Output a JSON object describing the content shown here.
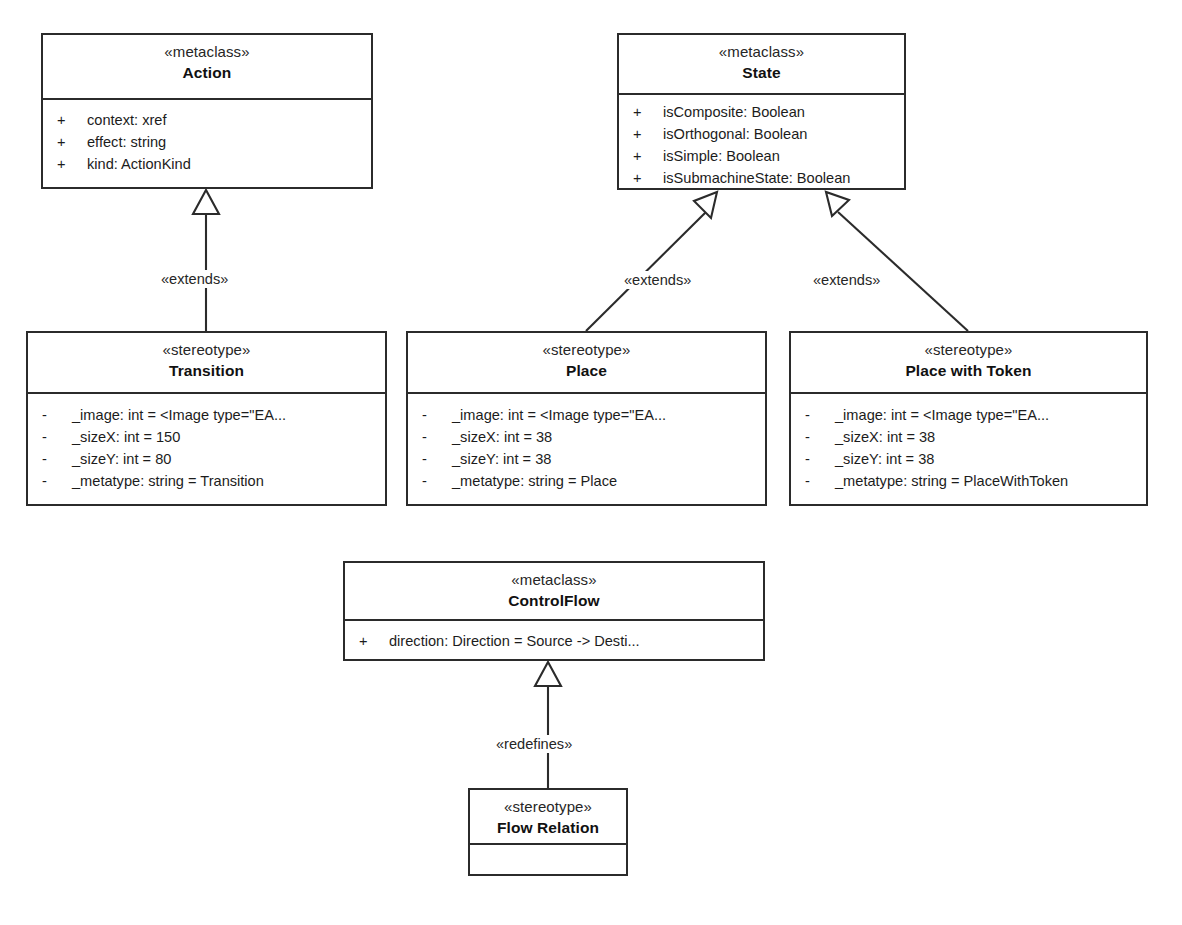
{
  "diagram": {
    "kind": "uml-class-diagram"
  },
  "classes": [
    {
      "id": "action",
      "stereotype": "«metaclass»",
      "name": "Action",
      "features": [
        {
          "visibility": "+",
          "text": "context:  xref"
        },
        {
          "visibility": "+",
          "text": "effect:  string"
        },
        {
          "visibility": "+",
          "text": "kind:  ActionKind"
        }
      ]
    },
    {
      "id": "state",
      "stereotype": "«metaclass»",
      "name": "State",
      "features": [
        {
          "visibility": "+",
          "text": "isComposite:  Boolean"
        },
        {
          "visibility": "+",
          "text": "isOrthogonal:  Boolean"
        },
        {
          "visibility": "+",
          "text": "isSimple:  Boolean"
        },
        {
          "visibility": "+",
          "text": "isSubmachineState:  Boolean"
        }
      ]
    },
    {
      "id": "transition",
      "stereotype": "«stereotype»",
      "name": "Transition",
      "features": [
        {
          "visibility": "-",
          "text": "_image:  int = <Image type=\"EA..."
        },
        {
          "visibility": "-",
          "text": "_sizeX:  int = 150"
        },
        {
          "visibility": "-",
          "text": "_sizeY:  int = 80"
        },
        {
          "visibility": "-",
          "text": "_metatype:  string = Transition"
        }
      ]
    },
    {
      "id": "place",
      "stereotype": "«stereotype»",
      "name": "Place",
      "features": [
        {
          "visibility": "-",
          "text": "_image:  int = <Image type=\"EA..."
        },
        {
          "visibility": "-",
          "text": "_sizeX:  int = 38"
        },
        {
          "visibility": "-",
          "text": "_sizeY:  int = 38"
        },
        {
          "visibility": "-",
          "text": "_metatype:  string = Place"
        }
      ]
    },
    {
      "id": "place-with-token",
      "stereotype": "«stereotype»",
      "name": "Place with Token",
      "features": [
        {
          "visibility": "-",
          "text": "_image:  int = <Image type=\"EA..."
        },
        {
          "visibility": "-",
          "text": "_sizeX:  int = 38"
        },
        {
          "visibility": "-",
          "text": "_sizeY:  int = 38"
        },
        {
          "visibility": "-",
          "text": "_metatype:  string = PlaceWithToken"
        }
      ]
    },
    {
      "id": "control-flow",
      "stereotype": "«metaclass»",
      "name": "ControlFlow",
      "features": [
        {
          "visibility": "+",
          "text": "direction:  Direction = Source -> Desti..."
        }
      ]
    },
    {
      "id": "flow-relation",
      "stereotype": "«stereotype»",
      "name": "Flow Relation",
      "features": []
    }
  ],
  "relationships": [
    {
      "id": "transition-extends-action",
      "label": "«extends»",
      "source": "Transition",
      "target": "Action"
    },
    {
      "id": "place-extends-state",
      "label": "«extends»",
      "source": "Place",
      "target": "State"
    },
    {
      "id": "place-with-token-extends-state",
      "label": "«extends»",
      "source": "Place with Token",
      "target": "State"
    },
    {
      "id": "flow-relation-redefines-control-flow",
      "label": "«redefines»",
      "source": "Flow Relation",
      "target": "ControlFlow"
    }
  ],
  "colors": {
    "line": "#2b2b2b",
    "fill": "#ffffff",
    "text": "#1a1a1a"
  }
}
